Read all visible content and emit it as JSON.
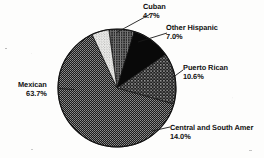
{
  "chart_data": {
    "type": "pie",
    "title": "",
    "subtitle": "",
    "xlabel": "",
    "ylabel": "",
    "legend_position": "callout-labels",
    "grid": false,
    "total": 100.0,
    "units": "percent",
    "start_angle_deg": 352,
    "direction": "clockwise",
    "categories": [
      "Other Hispanic",
      "Puerto Rican",
      "Central and South Amer",
      "Mexican",
      "Cuban"
    ],
    "values": [
      7.0,
      10.6,
      14.0,
      63.7,
      4.7
    ],
    "slices": [
      {
        "label": "Other Hispanic",
        "value": 7.0,
        "value_text": "7.0%",
        "fill": "dense-crosshatch",
        "color": "#3a3a3a",
        "label_x": 166,
        "label_y": 24
      },
      {
        "label": "Puerto Rican",
        "value": 10.6,
        "value_text": "10.6%",
        "fill": "solid-black",
        "color": "#0b0b0b",
        "label_x": 183,
        "label_y": 64
      },
      {
        "label": "Central and South Amer",
        "value": 14.0,
        "value_text": "14.0%",
        "fill": "coarse-grid",
        "color": "#4a4a4a",
        "label_x": 170,
        "label_y": 124
      },
      {
        "label": "Mexican",
        "value": 63.7,
        "value_text": "63.7%",
        "fill": "fine-dense-hatch",
        "color": "#343434",
        "label_x": 18,
        "label_y": 81
      },
      {
        "label": "Cuban",
        "value": 4.7,
        "value_text": "4.7%",
        "fill": "light-dotted",
        "color": "#e8e8e8",
        "label_x": 143,
        "label_y": 3
      }
    ],
    "geometry": {
      "center_x": 117,
      "center_y": 88,
      "radius": 59
    }
  },
  "labels": {
    "cuban": {
      "name": "Cuban",
      "pct": "4.7%"
    },
    "other_hispanic": {
      "name": "Other Hispanic",
      "pct": "7.0%"
    },
    "puerto_rican": {
      "name": "Puerto Rican",
      "pct": "10.6%"
    },
    "central_south": {
      "name": "Central and South Amer",
      "pct": "14.0%"
    },
    "mexican": {
      "name": "Mexican",
      "pct": "63.7%"
    }
  }
}
